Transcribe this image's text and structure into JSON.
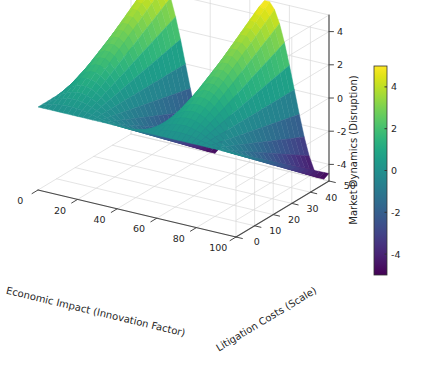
{
  "figure": {
    "background_color": "#ffffff",
    "width": 422,
    "height": 368,
    "projection": "3d",
    "colormap": "viridis"
  },
  "chart_data": {
    "type": "surface",
    "title": "",
    "xlabel": "Economic Impact (Innovation Factor)",
    "ylabel": "Litigation Costs (Scale)",
    "zlabel": "Market Dynamics (Disruption)",
    "xlim": [
      0,
      100
    ],
    "ylim": [
      0,
      50
    ],
    "zlim": [
      -5,
      5
    ],
    "xticks": [
      0,
      20,
      40,
      60,
      80,
      100
    ],
    "yticks": [
      0,
      10,
      20,
      30,
      40,
      50
    ],
    "zticks": [
      -4,
      -2,
      0,
      2,
      4
    ],
    "xticklabels": [
      "0",
      "20",
      "40",
      "60",
      "80",
      "100"
    ],
    "yticklabels": [
      "0",
      "10",
      "20",
      "30",
      "40",
      "50"
    ],
    "zticklabels": [
      "-4",
      "-2",
      "0",
      "2",
      "4"
    ],
    "grid": true,
    "pane_color": "#ffffff",
    "grid_color": "#d8d8d8",
    "colorbar": {
      "ticks": [
        -4,
        -2,
        0,
        2,
        4
      ],
      "ticklabels": [
        "-4",
        "-2",
        "0",
        "2",
        "4"
      ],
      "vmin": -5,
      "vmax": 5,
      "label": "",
      "position": "right",
      "orientation": "vertical"
    },
    "view": {
      "elev": 22,
      "azim": -62
    },
    "surface_description": "Two tall yellow-green ridges rising to about +5 separated by a deep blue valley dipping to about -5, decaying toward a flat teal plateau at low x.",
    "colormap_stops": [
      {
        "t": 0.0,
        "hex": "#440154"
      },
      {
        "t": 0.05,
        "hex": "#471365"
      },
      {
        "t": 0.1,
        "hex": "#482475"
      },
      {
        "t": 0.15,
        "hex": "#463480"
      },
      {
        "t": 0.2,
        "hex": "#414487"
      },
      {
        "t": 0.25,
        "hex": "#3b528b"
      },
      {
        "t": 0.3,
        "hex": "#355f8d"
      },
      {
        "t": 0.35,
        "hex": "#2f6c8e"
      },
      {
        "t": 0.4,
        "hex": "#2a788e"
      },
      {
        "t": 0.45,
        "hex": "#25848e"
      },
      {
        "t": 0.5,
        "hex": "#21908d"
      },
      {
        "t": 0.55,
        "hex": "#1e9c89"
      },
      {
        "t": 0.6,
        "hex": "#22a884"
      },
      {
        "t": 0.65,
        "hex": "#2fb47c"
      },
      {
        "t": 0.7,
        "hex": "#44bf70"
      },
      {
        "t": 0.75,
        "hex": "#5ec962"
      },
      {
        "t": 0.8,
        "hex": "#7ad151"
      },
      {
        "t": 0.85,
        "hex": "#9bd93c"
      },
      {
        "t": 0.9,
        "hex": "#bddf26"
      },
      {
        "t": 0.95,
        "hex": "#dfe318"
      },
      {
        "t": 1.0,
        "hex": "#fde725"
      }
    ],
    "z_formula": {
      "expression": "z = 5 * sin(2*pi*x/55) * (y/50)",
      "note": "Ridges at x~14 and x~68, trough at x~41; amplitude grows with y."
    },
    "x_samples": [
      0,
      2.5,
      5,
      7.5,
      10,
      12.5,
      15,
      17.5,
      20,
      22.5,
      25,
      27.5,
      30,
      32.5,
      35,
      37.5,
      40,
      42.5,
      45,
      47.5,
      50,
      52.5,
      55,
      57.5,
      60,
      62.5,
      65,
      67.5,
      70,
      72.5,
      75,
      77.5,
      80,
      82.5,
      85,
      87.5,
      90,
      92.5,
      95,
      97.5,
      100
    ],
    "y_samples": [
      0,
      2.5,
      5,
      7.5,
      10,
      12.5,
      15,
      17.5,
      20,
      22.5,
      25,
      27.5,
      30,
      32.5,
      35,
      37.5,
      40,
      42.5,
      45,
      47.5,
      50
    ]
  }
}
